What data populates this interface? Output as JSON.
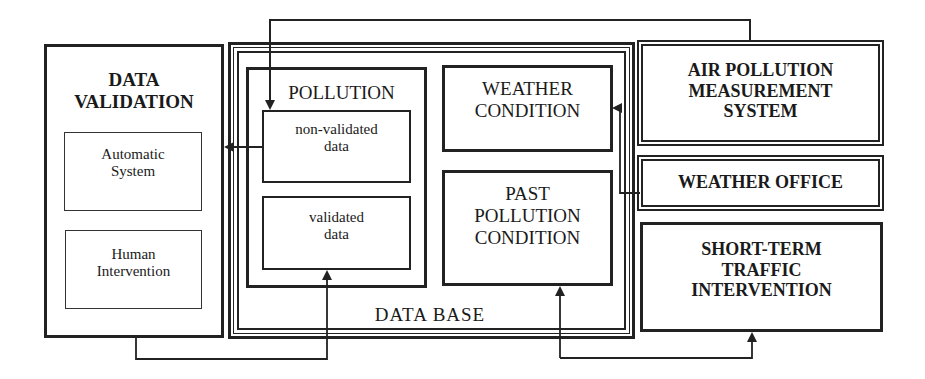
{
  "diagram": {
    "data_validation": {
      "title": "DATA\nVALIDATION",
      "automatic_system": "Automatic\nSystem",
      "human_intervention": "Human\nIntervention"
    },
    "data_base": {
      "label": "DATA BASE",
      "pollution": {
        "title": "POLLUTION",
        "non_validated": "non-validated\ndata",
        "validated": "validated\ndata"
      },
      "weather_condition": "WEATHER\nCONDITION",
      "past_pollution_condition": "PAST\nPOLLUTION\nCONDITION"
    },
    "air_pollution_measurement_system": "AIR POLLUTION\nMEASUREMENT\nSYSTEM",
    "weather_office": "WEATHER OFFICE",
    "short_term_traffic_intervention": "SHORT-TERM\nTRAFFIC\nINTERVENTION",
    "connections": [
      {
        "from": "air_pollution_measurement_system",
        "to": "non_validated_data"
      },
      {
        "from": "non_validated_data",
        "to": "data_validation"
      },
      {
        "from": "data_validation",
        "to": "validated_data"
      },
      {
        "from": "weather_office",
        "to": "weather_condition"
      },
      {
        "from": "data_base",
        "to": "past_pollution_condition"
      },
      {
        "from": "data_base",
        "to": "short_term_traffic_intervention"
      }
    ],
    "colors": {
      "line": "#222222",
      "background": "#ffffff"
    }
  }
}
